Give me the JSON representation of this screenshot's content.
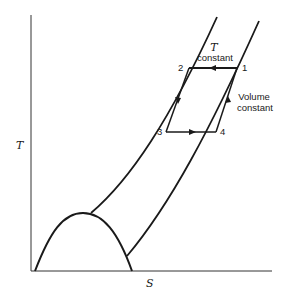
{
  "diagram": {
    "type": "T-S diagram (temperature–entropy) with refrigeration/thermodynamic cycle",
    "axes": {
      "x_label": "S",
      "y_label": "T"
    },
    "cycle": {
      "points": [
        {
          "id": "1",
          "label": "1"
        },
        {
          "id": "2",
          "label": "2"
        },
        {
          "id": "3",
          "label": "3"
        },
        {
          "id": "4",
          "label": "4"
        }
      ],
      "process_labels": {
        "isothermal_line1": "T",
        "isothermal_line2": "constant",
        "isochoric_line1": "Volume",
        "isochoric_line2": "constant"
      },
      "paths": [
        {
          "from": "1",
          "to": "2",
          "kind": "constant temperature"
        },
        {
          "from": "2",
          "to": "3",
          "kind": "constant volume"
        },
        {
          "from": "3",
          "to": "4",
          "kind": "constant temperature"
        },
        {
          "from": "4",
          "to": "1",
          "kind": "constant volume"
        }
      ]
    },
    "colors": {
      "line": "#1a1a1a",
      "background": "#ffffff"
    }
  }
}
